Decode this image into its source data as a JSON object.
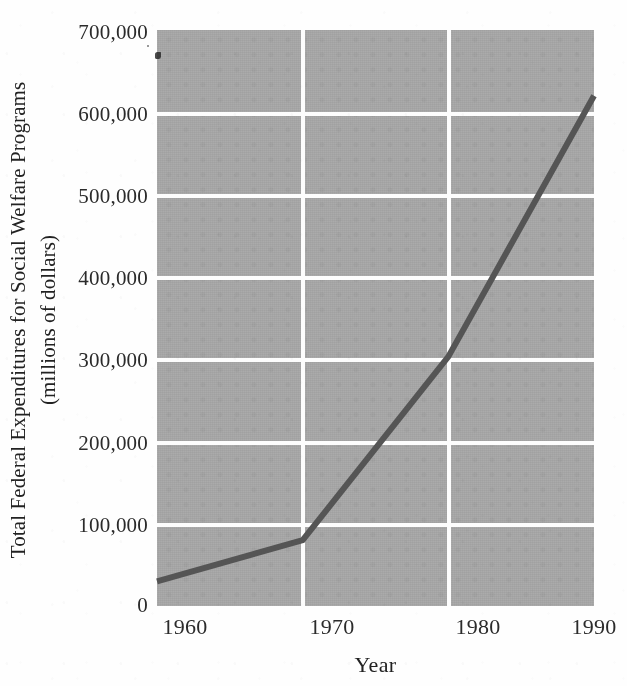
{
  "figure": {
    "background_color": "#fefefe",
    "plot_background_color": "#ababab",
    "gridline_color": "#fdfdfd",
    "line_color": "#555555"
  },
  "axes": {
    "y_title_line1": "Total Federal Expenditures for Social Welfare Programs",
    "y_title_line2": "(millions of dollars)",
    "x_title": "Year",
    "y_ticks": [
      "700,000",
      "600,000",
      "500,000",
      "400,000",
      "300,000",
      "200,000",
      "100,000",
      "0"
    ],
    "x_ticks": [
      "1960",
      "1970",
      "1980",
      "1990"
    ]
  },
  "chart_data": {
    "type": "line",
    "title": "",
    "xlabel": "Year",
    "ylabel": "Total Federal Expenditures for Social Welfare Programs (millions of dollars)",
    "x": [
      1960,
      1970,
      1980,
      1990
    ],
    "values": [
      30000,
      80000,
      303000,
      620000
    ],
    "series": [
      {
        "name": "Total Federal Expenditures for Social Welfare Programs",
        "values": [
          30000,
          80000,
          303000,
          620000
        ]
      }
    ],
    "xlim": [
      1960,
      1990
    ],
    "ylim": [
      0,
      700000
    ],
    "ytick_values": [
      0,
      100000,
      200000,
      300000,
      400000,
      500000,
      600000,
      700000
    ],
    "xtick_values": [
      1960,
      1970,
      1980,
      1990
    ],
    "grid": true,
    "legend": "none",
    "units": "millions of dollars"
  }
}
